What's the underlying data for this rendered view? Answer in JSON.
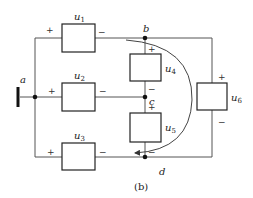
{
  "figure": {
    "caption": "(b)",
    "nodes": [
      {
        "id": "a",
        "label": "a"
      },
      {
        "id": "b",
        "label": "b"
      },
      {
        "id": "c",
        "label": "c"
      },
      {
        "id": "d",
        "label": "d"
      }
    ],
    "elements": [
      {
        "id": "u1",
        "label": "u",
        "sub": "1",
        "plus": "+",
        "minus": "−"
      },
      {
        "id": "u2",
        "label": "u",
        "sub": "2",
        "plus": "+",
        "minus": "−"
      },
      {
        "id": "u3",
        "label": "u",
        "sub": "3",
        "plus": "+",
        "minus": "−"
      },
      {
        "id": "u4",
        "label": "u",
        "sub": "4",
        "plus": "+",
        "minus": "−"
      },
      {
        "id": "u5",
        "label": "u",
        "sub": "5",
        "plus": "+",
        "minus": "−"
      },
      {
        "id": "u6",
        "label": "u",
        "sub": "6",
        "plus": "+",
        "minus": "−"
      }
    ],
    "loop_arrow": {
      "from": "b",
      "to": "d",
      "direction": "clockwise"
    },
    "colors": {
      "wire": "#555555",
      "box": "#222222",
      "text": "#222222"
    }
  }
}
